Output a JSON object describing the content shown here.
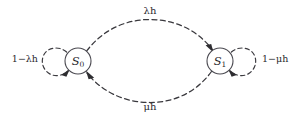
{
  "diagram": {
    "type": "markov-chain-state-transition-diagram",
    "background_color": "#ffffff",
    "stroke_color": "#39383d",
    "nodes": [
      {
        "id": "S0",
        "label_base": "S",
        "label_sub": "0",
        "cx": 78,
        "cy": 61,
        "r": 13
      },
      {
        "id": "S1",
        "label_base": "S",
        "label_sub": "1",
        "cx": 220,
        "cy": 61,
        "r": 13
      }
    ],
    "edges": [
      {
        "id": "S0-to-S1",
        "from": "S0",
        "to": "S1",
        "label": "λh",
        "label_x": 150,
        "label_y": 11,
        "style": "dashed-arc-top"
      },
      {
        "id": "S1-to-S0",
        "from": "S1",
        "to": "S0",
        "label": "μh",
        "label_x": 150,
        "label_y": 107,
        "style": "dashed-arc-bottom"
      }
    ],
    "self_loops": [
      {
        "id": "S0-self-loop",
        "node": "S0",
        "label": "1−λh",
        "label_x": 38,
        "label_y": 59,
        "side": "left"
      },
      {
        "id": "S1-self-loop",
        "node": "S1",
        "label": "1−μh",
        "label_x": 262,
        "label_y": 59,
        "side": "right"
      }
    ]
  }
}
